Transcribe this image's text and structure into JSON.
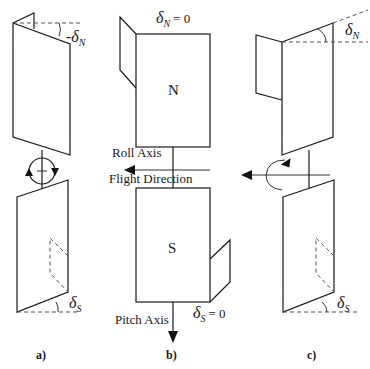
{
  "figure": {
    "colors": {
      "line": "#1a1a1a",
      "dashed": "#555555",
      "background": "#ffffff"
    }
  },
  "panels": {
    "a": {
      "label": "a)",
      "top_angle": {
        "prefix": "-",
        "symbol": "δ",
        "subscript": "N"
      },
      "bottom_angle": {
        "symbol": "δ",
        "subscript": "S"
      },
      "rotation_indicator": "circle-arrows-opposing"
    },
    "b": {
      "label": "b)",
      "north_panel_label": "N",
      "south_panel_label": "S",
      "top_angle": {
        "symbol": "δ",
        "subscript": "N",
        "equals": "= 0"
      },
      "bottom_angle": {
        "symbol": "δ",
        "subscript": "S",
        "equals": "= 0"
      },
      "roll_axis_label": "Roll Axis",
      "flight_direction_label": "Flight Direction",
      "pitch_axis_label": "Pitch Axis"
    },
    "c": {
      "label": "c)",
      "top_angle": {
        "symbol": "δ",
        "subscript": "N"
      },
      "bottom_angle": {
        "symbol": "δ",
        "subscript": "S"
      },
      "rotation_indicator": "roll-arc-arrow"
    }
  }
}
